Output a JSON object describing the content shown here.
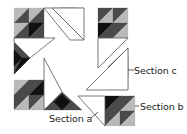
{
  "diagram": {
    "colors": {
      "black": "#111111",
      "dark": "#4a4a4a",
      "medium": "#8c8c8c",
      "light": "#b9b9b9",
      "white": "#ffffff",
      "outline": "#555555",
      "leader": "#333333"
    },
    "labels": {
      "section_a": "Section a",
      "section_b": "Section b",
      "section_c": "Section c"
    },
    "triangles": [
      {
        "pts": "14,8 29,8 14,23",
        "fill": "light"
      },
      {
        "pts": "29,8 14,23 29,23",
        "fill": "dark"
      },
      {
        "pts": "29,8 44,8 29,23",
        "fill": "light"
      },
      {
        "pts": "44,8 29,23 44,23",
        "fill": "dark"
      },
      {
        "pts": "14,23 29,23 14,38",
        "fill": "light"
      },
      {
        "pts": "29,23 14,38 29,38",
        "fill": "dark"
      },
      {
        "pts": "29,23 44,23 29,38",
        "fill": "black"
      },
      {
        "pts": "44,23 29,38 44,38",
        "fill": "dark"
      },
      {
        "pts": "52,8 68,22 84,8",
        "fill": "dark"
      },
      {
        "pts": "60,8 68,15 76,8",
        "fill": "black"
      },
      {
        "pts": "68,22 60,15 76,15",
        "fill": "black"
      },
      {
        "pts": "98,8 113,8 98,23",
        "fill": "dark"
      },
      {
        "pts": "113,8 98,23 113,23",
        "fill": "light"
      },
      {
        "pts": "113,8 128,8 113,23",
        "fill": "dark"
      },
      {
        "pts": "128,8 113,23 128,23",
        "fill": "light"
      },
      {
        "pts": "98,23 113,23 98,38",
        "fill": "black"
      },
      {
        "pts": "113,23 98,38 113,38",
        "fill": "dark"
      },
      {
        "pts": "113,23 128,23 113,38",
        "fill": "dark"
      },
      {
        "pts": "128,23 113,38 128,38",
        "fill": "light"
      },
      {
        "pts": "14,42 14,74 30,58",
        "fill": "dark"
      },
      {
        "pts": "14,50 14,66 22,58",
        "fill": "black"
      },
      {
        "pts": "22,58 30,58 14,74",
        "fill": "black"
      },
      {
        "pts": "128,48 128,86 108,67",
        "fill": "dark"
      },
      {
        "pts": "128,57 128,77 117,67",
        "fill": "black"
      },
      {
        "pts": "14,80 29,80 14,95",
        "fill": "light"
      },
      {
        "pts": "29,80 14,95 29,95",
        "fill": "dark"
      },
      {
        "pts": "29,80 44,80 29,95",
        "fill": "dark"
      },
      {
        "pts": "44,80 29,95 44,95",
        "fill": "black"
      },
      {
        "pts": "14,95 29,95 14,110",
        "fill": "dark"
      },
      {
        "pts": "29,95 14,110 29,110",
        "fill": "light"
      },
      {
        "pts": "29,95 44,95 29,110",
        "fill": "dark"
      },
      {
        "pts": "44,95 29,110 44,110",
        "fill": "light"
      },
      {
        "pts": "44,110 62,92 82,110",
        "fill": "dark"
      },
      {
        "pts": "54,102 62,110 70,102",
        "fill": "black"
      },
      {
        "pts": "62,94 54,102 70,102",
        "fill": "black"
      },
      {
        "pts": "105,96 120,96 105,111",
        "fill": "black"
      },
      {
        "pts": "120,96 105,111 120,111",
        "fill": "dark"
      },
      {
        "pts": "120,96 135,96 120,111",
        "fill": "dark"
      },
      {
        "pts": "135,96 120,111 135,111",
        "fill": "light"
      },
      {
        "pts": "105,111 120,111 105,126",
        "fill": "dark"
      },
      {
        "pts": "120,111 105,126 120,126",
        "fill": "light"
      },
      {
        "pts": "120,111 135,111 120,126",
        "fill": "dark"
      },
      {
        "pts": "135,111 120,126 135,126",
        "fill": "light"
      }
    ],
    "white_pieces": [
      {
        "pts": "44,8 52,8 84,40 70,40",
        "name": "top-left-blade"
      },
      {
        "pts": "52,8 84,8 84,40",
        "name": "top-center-white-triangle"
      },
      {
        "pts": "98,38 128,38 98,68",
        "name": "right-upper-white-triangle"
      },
      {
        "pts": "86,90 128,48 128,90",
        "name": "section-c-white-triangle"
      },
      {
        "pts": "14,38 55,38 30,58 14,42",
        "name": "left-white-triangle"
      },
      {
        "pts": "44,58 44,110 62,92",
        "name": "lower-left-white-triangle"
      },
      {
        "pts": "78,96 105,96 105,126",
        "name": "section-a-white-triangle"
      }
    ],
    "outlines": [
      "14,8 128,8",
      "14,8 14,110",
      "14,110 82,110",
      "128,8 128,90"
    ]
  }
}
